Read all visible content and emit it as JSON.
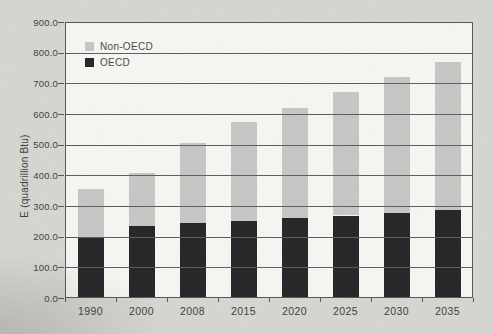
{
  "page": {
    "background_color": "#d6d6d1",
    "plot_background_color": "#f6f6f2",
    "axis_color": "#54555a",
    "text_color": "#3a3b3e"
  },
  "chart_data": {
    "type": "bar",
    "stacked": true,
    "title": "",
    "xlabel": "",
    "ylabel": "E (quadrillion Btu)",
    "ylim": [
      0,
      900
    ],
    "ytick_step": 100,
    "yticks": [
      "0.0",
      "100.0",
      "200.0",
      "300.0",
      "400.0",
      "500.0",
      "600.0",
      "700.0",
      "800.0",
      "900.0"
    ],
    "categories": [
      "1990",
      "2000",
      "2008",
      "2015",
      "2020",
      "2025",
      "2030",
      "2035"
    ],
    "series": [
      {
        "name": "OECD",
        "color": "#232224",
        "values": [
          200,
          234,
          244,
          250,
          260,
          269,
          278,
          288
        ]
      },
      {
        "name": "Non-OECD",
        "color": "#c6c7c4",
        "values": [
          155,
          172,
          260,
          323,
          359,
          402,
          443,
          482
        ]
      }
    ],
    "stacked_totals": [
      355,
      406,
      504,
      573,
      619,
      671,
      721,
      770
    ],
    "grid": true,
    "gridlines_over_bars": true,
    "legend": {
      "position": "top-left",
      "entries": [
        "Non-OECD",
        "OECD"
      ]
    }
  }
}
